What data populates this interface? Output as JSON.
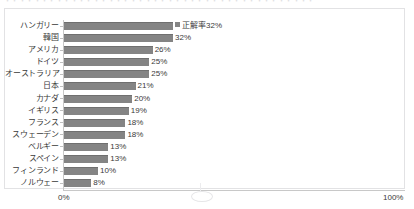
{
  "top_clip": {
    "text": "・・・・・・・・・・・・・・・・・・・・・・・・・・・・・・・・・・・・・・・・・・"
  },
  "axis": {
    "x_min_label": "0%",
    "x_max_label": "100%"
  },
  "series_label": "正解率",
  "colors": {
    "bar": "#848484",
    "bar_edge": "#6f6f6f",
    "frame": "#e2e2e4",
    "axis": "#c8c8c8",
    "text": "#3a3a3a"
  },
  "chart_data": {
    "type": "bar",
    "orientation": "horizontal",
    "title": "",
    "xlabel": "",
    "ylabel": "",
    "xlim": [
      0,
      100
    ],
    "grid": false,
    "legend": "正解率",
    "legend_position": "inline-first-bar",
    "categories": [
      "ハンガリー",
      "韓国",
      "アメリカ",
      "ドイツ",
      "オーストラリア",
      "日本",
      "カナダ",
      "イギリス",
      "フランス",
      "スウェーデン",
      "ベルギー",
      "スペイン",
      "フィンランド",
      "ノルウェー"
    ],
    "values": [
      32,
      32,
      26,
      25,
      25,
      21,
      20,
      19,
      18,
      18,
      13,
      13,
      10,
      8
    ],
    "value_labels": [
      "正解率32%",
      "32%",
      "26%",
      "25%",
      "25%",
      "21%",
      "20%",
      "19%",
      "18%",
      "18%",
      "13%",
      "13%",
      "10%",
      "8%"
    ],
    "rows": [
      {
        "category": "ハンガリー",
        "value": 32,
        "label": "正解率32%",
        "has_legend_marker": true
      },
      {
        "category": "韓国",
        "value": 32,
        "label": "32%",
        "has_legend_marker": false
      },
      {
        "category": "アメリカ",
        "value": 26,
        "label": "26%",
        "has_legend_marker": false
      },
      {
        "category": "ドイツ",
        "value": 25,
        "label": "25%",
        "has_legend_marker": false
      },
      {
        "category": "オーストラリア",
        "value": 25,
        "label": "25%",
        "has_legend_marker": false
      },
      {
        "category": "日本",
        "value": 21,
        "label": "21%",
        "has_legend_marker": false
      },
      {
        "category": "カナダ",
        "value": 20,
        "label": "20%",
        "has_legend_marker": false
      },
      {
        "category": "イギリス",
        "value": 19,
        "label": "19%",
        "has_legend_marker": false
      },
      {
        "category": "フランス",
        "value": 18,
        "label": "18%",
        "has_legend_marker": false
      },
      {
        "category": "スウェーデン",
        "value": 18,
        "label": "18%",
        "has_legend_marker": false
      },
      {
        "category": "ベルギー",
        "value": 13,
        "label": "13%",
        "has_legend_marker": false
      },
      {
        "category": "スペイン",
        "value": 13,
        "label": "13%",
        "has_legend_marker": false
      },
      {
        "category": "フィンランド",
        "value": 10,
        "label": "10%",
        "has_legend_marker": false
      },
      {
        "category": "ノルウェー",
        "value": 8,
        "label": "8%",
        "has_legend_marker": false
      }
    ]
  }
}
